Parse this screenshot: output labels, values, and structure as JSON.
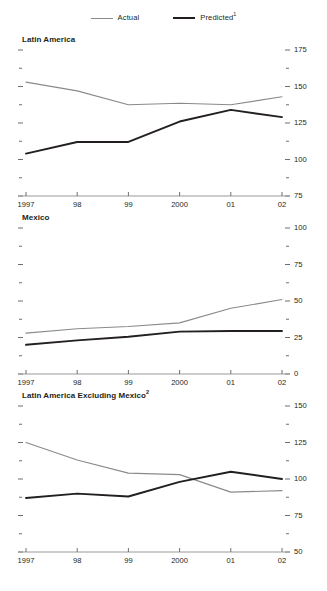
{
  "legend": {
    "items": [
      {
        "label": "Actual",
        "style": "actual",
        "color": "#8a8a8a"
      },
      {
        "label": "Predicted",
        "sup": "1",
        "style": "predicted",
        "color": "#231f20"
      }
    ]
  },
  "chart_data": [
    {
      "type": "line",
      "title": "Latin America",
      "title_sup": "",
      "xlabel": "",
      "ylabel": "",
      "x": [
        1997,
        1998,
        1999,
        2000,
        2001,
        2002
      ],
      "xticklabels": [
        "1997",
        "98",
        "99",
        "2000",
        "01",
        "02"
      ],
      "ylim": [
        75,
        175
      ],
      "yticks": [
        75,
        100,
        125,
        150,
        175
      ],
      "yticklabels": [
        "75",
        "100",
        "125",
        "150",
        "175"
      ],
      "minor_yticks": [
        87.5,
        112.5,
        137.5,
        162.5
      ],
      "grid": false,
      "legend_position": "top-center",
      "series": [
        {
          "name": "Actual",
          "values": [
            153,
            147,
            137.5,
            138.5,
            137.5,
            143
          ]
        },
        {
          "name": "Predicted",
          "values": [
            104,
            112,
            112,
            126,
            134,
            129
          ]
        }
      ]
    },
    {
      "type": "line",
      "title": "Mexico",
      "title_sup": "",
      "xlabel": "",
      "ylabel": "",
      "x": [
        1997,
        1998,
        1999,
        2000,
        2001,
        2002
      ],
      "xticklabels": [
        "1997",
        "98",
        "99",
        "2000",
        "01",
        "02"
      ],
      "ylim": [
        0,
        100
      ],
      "yticks": [
        0,
        25,
        50,
        75,
        100
      ],
      "yticklabels": [
        "0",
        "25",
        "50",
        "75",
        "100"
      ],
      "minor_yticks": [
        12.5,
        37.5,
        62.5,
        87.5
      ],
      "grid": false,
      "legend_position": "top-center",
      "series": [
        {
          "name": "Actual",
          "values": [
            28,
            31,
            32.5,
            35,
            45,
            51
          ]
        },
        {
          "name": "Predicted",
          "values": [
            20,
            23,
            25.5,
            29,
            29.5,
            29.5
          ]
        }
      ]
    },
    {
      "type": "line",
      "title": "Latin America Excluding Mexico",
      "title_sup": "2",
      "xlabel": "",
      "ylabel": "",
      "x": [
        1997,
        1998,
        1999,
        2000,
        2001,
        2002
      ],
      "xticklabels": [
        "1997",
        "98",
        "99",
        "2000",
        "01",
        "02"
      ],
      "ylim": [
        50,
        150
      ],
      "yticks": [
        50,
        75,
        100,
        125,
        150
      ],
      "yticklabels": [
        "50",
        "75",
        "100",
        "125",
        "150"
      ],
      "minor_yticks": [
        62.5,
        87.5,
        112.5,
        137.5
      ],
      "grid": false,
      "legend_position": "top-center",
      "series": [
        {
          "name": "Actual",
          "values": [
            125,
            113,
            104,
            103,
            91,
            92
          ]
        },
        {
          "name": "Predicted",
          "values": [
            87,
            90,
            88,
            98,
            105,
            100
          ]
        }
      ]
    }
  ]
}
